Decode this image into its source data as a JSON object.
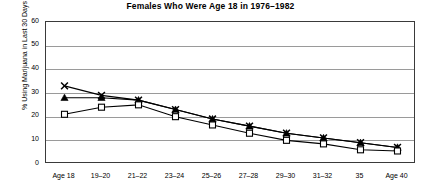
{
  "chart_data": {
    "type": "line",
    "title": "Females Who Were Age 18 in 1976–1982",
    "xlabel": "",
    "ylabel": "% Using Marijuana in Last 30 Days",
    "ylim": [
      0,
      60
    ],
    "ytick_step": 10,
    "yticks": [
      "0",
      "10",
      "20",
      "30",
      "40",
      "50",
      "60"
    ],
    "grid": true,
    "legend": "none",
    "categories": [
      "Age 18",
      "19–20",
      "21–22",
      "23–24",
      "25–26",
      "27–28",
      "29–30",
      "31–32",
      "35",
      "Age 40"
    ],
    "series": [
      {
        "name": "x-marker-series",
        "marker": "x",
        "values": [
          33,
          29,
          27,
          23,
          19,
          16,
          13,
          11,
          9,
          7
        ]
      },
      {
        "name": "triangle-marker-series",
        "marker": "triangle",
        "values": [
          28,
          28,
          27,
          23,
          19,
          16,
          13,
          11,
          9,
          7
        ]
      },
      {
        "name": "square-marker-series",
        "marker": "square",
        "values": [
          21,
          24,
          25,
          20,
          16.5,
          13,
          10,
          8.5,
          6,
          5.5
        ]
      }
    ]
  }
}
